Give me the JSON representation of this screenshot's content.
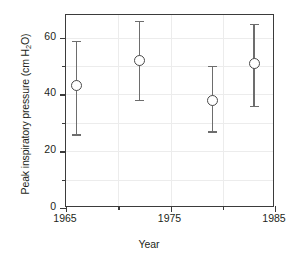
{
  "chart_data": {
    "type": "scatter",
    "title": "",
    "xlabel": "Year",
    "ylabel": "Peak inspiratory pressure (cm H",
    "ylabel_sub": "2",
    "ylabel_tail": "O)",
    "ylabel_full": "Peak inspiratory pressure (cm H2O)",
    "xlim": [
      1965,
      1985
    ],
    "ylim": [
      0,
      68
    ],
    "grid": true,
    "legend": "none",
    "x_ticks_major": [
      1965,
      1975,
      1985
    ],
    "x_ticks_minor": [
      1970,
      1980
    ],
    "x_tick_labels": [
      "1965",
      "1975",
      "1985"
    ],
    "y_ticks_major": [
      0,
      20,
      40,
      60
    ],
    "y_ticks_minor": [
      10,
      30,
      50
    ],
    "y_tick_labels": [
      "0",
      "20",
      "40",
      "60"
    ],
    "gridlines_y": [
      10,
      20,
      30,
      40,
      50,
      60
    ],
    "gridlines_x": [
      1970,
      1975,
      1980
    ],
    "marker_style": "open-circle",
    "errorbar_style": "capped-vertical",
    "points": [
      {
        "x": 1966,
        "y": 43,
        "yerr_low": 26,
        "yerr_high": 59
      },
      {
        "x": 1972,
        "y": 52,
        "yerr_low": 38,
        "yerr_high": 66
      },
      {
        "x": 1979,
        "y": 38,
        "yerr_low": 27,
        "yerr_high": 50
      },
      {
        "x": 1983,
        "y": 51,
        "yerr_low": 36,
        "yerr_high": 65
      }
    ],
    "colors": {
      "frame": "#3b3b3b",
      "grid": "#ececec",
      "marker_stroke": "#4a4a4a",
      "marker_fill": "#ffffff",
      "errorbar": "#6d6d6d",
      "text": "#231f20",
      "background": "#ffffff"
    }
  }
}
